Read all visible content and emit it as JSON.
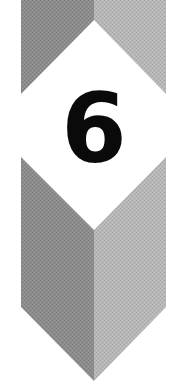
{
  "badge": {
    "number": "6",
    "number_color": "#0a0a0a",
    "colors": {
      "left_face": "#8c8c8c",
      "right_face": "#b6b6b6",
      "background": "#ffffff"
    },
    "shapes": [
      {
        "name": "top-chevron",
        "description": "gray rectangle with V-notch at bottom, split into dark left and light right halves"
      },
      {
        "name": "bottom-chevron",
        "description": "gray pointed shield with V-notch at top, split into dark left and light right halves"
      }
    ]
  }
}
